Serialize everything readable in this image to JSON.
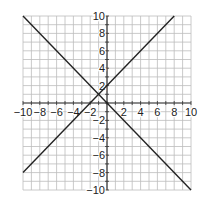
{
  "chart_data": {
    "type": "line",
    "title": "",
    "xlabel": "",
    "ylabel": "",
    "xlim": [
      -10,
      10
    ],
    "ylim": [
      -10,
      10
    ],
    "grid": true,
    "grid_step": 1,
    "x_ticks": [
      -10,
      -8,
      -6,
      -4,
      -2,
      2,
      4,
      6,
      8,
      10
    ],
    "y_ticks": [
      10,
      8,
      6,
      4,
      2,
      -2,
      -4,
      -6,
      -8,
      -10
    ],
    "x_tick_labels": [
      "−10",
      "−8",
      "−6",
      "−4",
      "−2",
      "2",
      "4",
      "6",
      "8",
      "10"
    ],
    "y_tick_labels": [
      "10",
      "8",
      "6",
      "4",
      "2",
      "−2",
      "−4",
      "−6",
      "−8",
      "−10"
    ],
    "series": [
      {
        "name": "y = -x",
        "points": [
          [
            -10,
            10
          ],
          [
            10,
            -10
          ]
        ]
      },
      {
        "name": "y = x + 2",
        "points": [
          [
            -10,
            -8
          ],
          [
            8,
            10
          ]
        ]
      }
    ],
    "intersection": [
      -1,
      1
    ],
    "colors": {
      "line": "#222222",
      "grid": "#bdbdbd",
      "axis": "#333333"
    }
  }
}
